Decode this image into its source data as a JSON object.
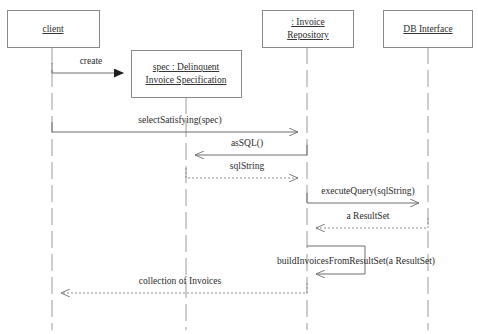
{
  "diagram": {
    "type": "uml-sequence-diagram",
    "canvas": {
      "width": 478,
      "height": 334,
      "background": "#ffffff"
    },
    "stroke_color": "#8a8a8a",
    "text_color": "#2b2b2b"
  },
  "participants": [
    {
      "id": "client",
      "label_lines": [
        "client"
      ],
      "label": "client",
      "box": {
        "x": 7,
        "y": 10,
        "w": 92,
        "h": 37
      },
      "lifeline_x": 52,
      "lifeline_top": 47,
      "lifeline_bottom": 330
    },
    {
      "id": "spec",
      "label_lines": [
        "spec : Delinquent",
        "Invoice Specification"
      ],
      "label": "spec : Delinquent Invoice Specification",
      "box": {
        "x": 131,
        "y": 50,
        "w": 110,
        "h": 47
      },
      "lifeline_x": 186,
      "lifeline_top": 97,
      "lifeline_bottom": 330
    },
    {
      "id": "invoice-repository",
      "label_lines": [
        ": Invoice",
        "Repository"
      ],
      "label": ": Invoice Repository",
      "box": {
        "x": 262,
        "y": 10,
        "w": 91,
        "h": 37
      },
      "lifeline_x": 307,
      "lifeline_top": 47,
      "lifeline_bottom": 330
    },
    {
      "id": "db-interface",
      "label_lines": [
        "DB Interface"
      ],
      "label": "DB Interface",
      "box": {
        "x": 383,
        "y": 10,
        "w": 89,
        "h": 37
      },
      "lifeline_x": 428,
      "lifeline_top": 47,
      "lifeline_bottom": 330
    }
  ],
  "messages": [
    {
      "id": "create",
      "label": "create",
      "from": "client",
      "to": "spec",
      "style": "solid",
      "arrow": "filled",
      "direction": "right",
      "x1": 52,
      "x2": 131,
      "y": 73,
      "label_x": 91,
      "label_y": 64
    },
    {
      "id": "select-satisfying",
      "label": "selectSatisfying(spec)",
      "from": "client",
      "to": "invoice-repository",
      "style": "solid",
      "arrow": "open",
      "direction": "right",
      "x1": 52,
      "x2": 307,
      "y": 132,
      "label_x": 180,
      "label_y": 123
    },
    {
      "id": "as-sql",
      "label": "asSQL()",
      "from": "invoice-repository",
      "to": "spec",
      "style": "solid",
      "arrow": "open",
      "direction": "left",
      "x1": 307,
      "x2": 186,
      "y": 155,
      "label_x": 247,
      "label_y": 146
    },
    {
      "id": "sql-string",
      "label": "sqlString",
      "from": "spec",
      "to": "invoice-repository",
      "style": "dashed",
      "arrow": "open",
      "direction": "right",
      "x1": 186,
      "x2": 307,
      "y": 178,
      "label_x": 247,
      "label_y": 169
    },
    {
      "id": "execute-query",
      "label": "executeQuery(sqlString)",
      "from": "invoice-repository",
      "to": "db-interface",
      "style": "solid",
      "arrow": "open",
      "direction": "right",
      "x1": 307,
      "x2": 428,
      "y": 203,
      "label_x": 368,
      "label_y": 194
    },
    {
      "id": "a-result-set",
      "label": "a ResultSet",
      "from": "db-interface",
      "to": "invoice-repository",
      "style": "dashed",
      "arrow": "open",
      "direction": "left",
      "x1": 428,
      "x2": 307,
      "y": 228,
      "label_x": 368,
      "label_y": 219
    },
    {
      "id": "collection-of-invoices",
      "label": "collection of Invoices",
      "from": "invoice-repository",
      "to": "client",
      "style": "dashed",
      "arrow": "open",
      "direction": "left",
      "x1": 307,
      "x2": 52,
      "y": 293,
      "label_x": 180,
      "label_y": 284
    }
  ],
  "self_calls": [
    {
      "id": "build-invoices-from-result-set",
      "label": "buildInvoicesFromResultSet(a ResultSet)",
      "on": "invoice-repository",
      "style": "solid",
      "arrow": "open",
      "x": 307,
      "right_x": 365,
      "y_top": 246,
      "y_bottom": 274,
      "label_x": 356,
      "label_y": 264
    }
  ],
  "caption": {
    "text": "",
    "x": 239,
    "y": 332
  }
}
